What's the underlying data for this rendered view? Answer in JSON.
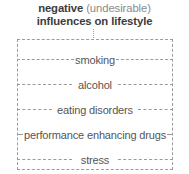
{
  "title": {
    "line1_bold": "negative",
    "line1_regular": " (undesirable)",
    "line2_bold": "influences on lifestyle"
  },
  "colors": {
    "title_bold": "#3c3c3c",
    "title_regular": "#8a8a8a",
    "label": "#555555",
    "dash": "#9b9b9b",
    "background": "#ffffff"
  },
  "chart_data": {
    "type": "diagram",
    "title": "negative (undesirable) influences on lifestyle",
    "items": [
      "smoking",
      "alcohol",
      "eating disorders",
      "performance enhancing drugs",
      "stress"
    ]
  },
  "rows": [
    {
      "label": "smoking"
    },
    {
      "label": "alcohol"
    },
    {
      "label": "eating disorders"
    },
    {
      "label": "performance enhancing drugs"
    },
    {
      "label": "stress"
    }
  ]
}
